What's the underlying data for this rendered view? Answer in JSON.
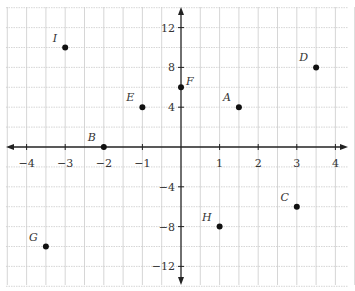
{
  "chart_data": {
    "type": "scatter",
    "title": "",
    "xlabel": "",
    "ylabel": "",
    "xlim": [
      -4.5,
      4.5
    ],
    "ylim": [
      -14,
      14
    ],
    "grid": true,
    "x_ticks": [
      -4,
      -3,
      -2,
      -1,
      1,
      2,
      3,
      4
    ],
    "y_ticks": [
      12,
      8,
      4,
      -4,
      -8,
      -12
    ],
    "points": [
      {
        "label": "A",
        "x": 1.5,
        "y": 4
      },
      {
        "label": "B",
        "x": -2,
        "y": 0
      },
      {
        "label": "C",
        "x": 3,
        "y": -6
      },
      {
        "label": "D",
        "x": 3.5,
        "y": 8
      },
      {
        "label": "E",
        "x": -1,
        "y": 4
      },
      {
        "label": "F",
        "x": 0,
        "y": 6
      },
      {
        "label": "G",
        "x": -3.5,
        "y": -10
      },
      {
        "label": "H",
        "x": 1,
        "y": -8
      },
      {
        "label": "I",
        "x": -3,
        "y": 10
      }
    ]
  },
  "colors": {
    "axis": "#222222",
    "grid": "#cccccc",
    "point": "#111111",
    "text": "#333333"
  }
}
